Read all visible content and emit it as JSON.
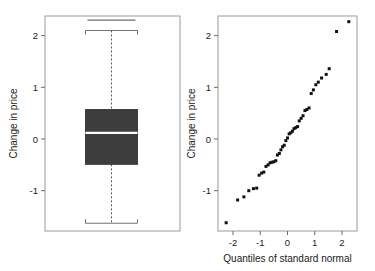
{
  "figure": {
    "background": "#ffffff",
    "panels": [
      "boxplot-panel",
      "qq-panel"
    ]
  },
  "chart_data": [
    {
      "type": "box",
      "name": "boxplot",
      "title": "",
      "xlabel": "",
      "ylabel": "Change in price",
      "ylim": [
        -1.78,
        2.38
      ],
      "yticks": [
        -1,
        0,
        1,
        2
      ],
      "yticklabels": [
        "-1",
        "0",
        "1",
        "2"
      ],
      "grid": false,
      "box_fill": "#3d3d3d",
      "median_color": "#ffffff",
      "whisker_style": "dashed",
      "boxes": [
        {
          "label": "Change in price",
          "min_outlier": 2.3,
          "whisker_high": 2.1,
          "q3": 0.57,
          "median": 0.12,
          "q1": -0.49,
          "whisker_low": -1.63,
          "outliers": [
            2.3
          ]
        }
      ]
    },
    {
      "type": "scatter",
      "name": "normal-qq-plot",
      "title": "",
      "xlabel": "Quantiles of standard normal",
      "ylabel": "Change in price",
      "xlim": [
        -2.55,
        2.55
      ],
      "ylim": [
        -1.78,
        2.38
      ],
      "xticks": [
        -2,
        -1,
        0,
        1,
        2
      ],
      "xticklabels": [
        "-2",
        "-1",
        "0",
        "1",
        "2"
      ],
      "yticks": [
        -1,
        0,
        1,
        2
      ],
      "yticklabels": [
        "-1",
        "0",
        "1",
        "2"
      ],
      "grid": false,
      "marker": "filled-square",
      "marker_color": "#111111",
      "marker_size": 3,
      "x": [
        -2.25,
        -1.83,
        -1.6,
        -1.42,
        -1.25,
        -1.13,
        -1.04,
        -0.95,
        -0.87,
        -0.79,
        -0.71,
        -0.64,
        -0.57,
        -0.5,
        -0.43,
        -0.37,
        -0.3,
        -0.24,
        -0.18,
        -0.12,
        -0.06,
        0.0,
        0.06,
        0.12,
        0.18,
        0.24,
        0.3,
        0.37,
        0.43,
        0.5,
        0.57,
        0.64,
        0.71,
        0.79,
        0.87,
        0.95,
        1.04,
        1.13,
        1.25,
        1.42,
        1.53,
        1.8,
        2.25
      ],
      "y": [
        -1.62,
        -1.18,
        -1.12,
        -1.0,
        -0.96,
        -0.95,
        -0.7,
        -0.66,
        -0.64,
        -0.53,
        -0.5,
        -0.46,
        -0.45,
        -0.44,
        -0.42,
        -0.31,
        -0.28,
        -0.21,
        -0.15,
        -0.12,
        -0.03,
        0.02,
        0.1,
        0.12,
        0.15,
        0.2,
        0.22,
        0.24,
        0.35,
        0.4,
        0.45,
        0.55,
        0.57,
        0.6,
        0.88,
        0.95,
        1.05,
        1.1,
        1.18,
        1.25,
        1.36,
        2.08,
        2.27
      ]
    }
  ],
  "labels": {
    "left_ylabel": "Change in price",
    "right_ylabel": "Change in price",
    "right_xlabel": "Quantiles of standard normal"
  }
}
